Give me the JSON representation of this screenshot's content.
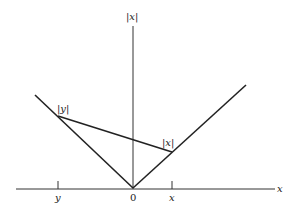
{
  "diagram": {
    "x_axis_label": "x",
    "y_axis_label": "|x|",
    "origin_label": "0",
    "tick_labels": [
      "y",
      "x"
    ],
    "point_labels": {
      "left_point": "|y|",
      "right_point": "|x|"
    },
    "colors": {
      "line": "#222222",
      "background": "#ffffff"
    }
  }
}
